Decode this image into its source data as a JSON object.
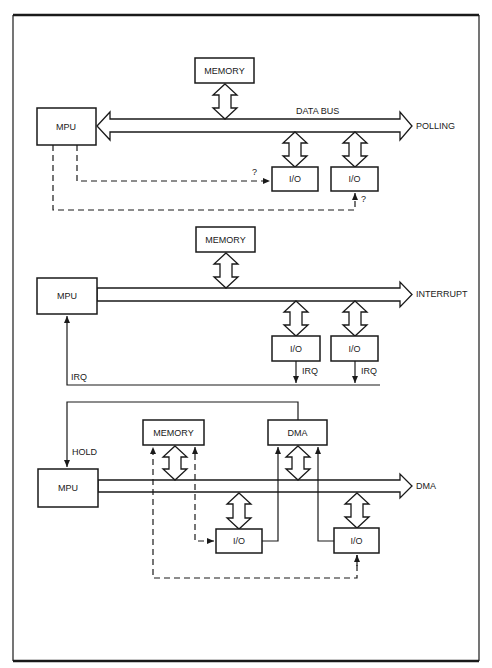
{
  "diagram": {
    "panels": [
      {
        "id": "polling",
        "mode_label": "POLLING",
        "bus_label": "DATA BUS",
        "mpu_label": "MPU",
        "memory_label": "MEMORY",
        "io_labels": [
          "I/O",
          "I/O"
        ],
        "query_labels": [
          "?",
          "?"
        ]
      },
      {
        "id": "interrupt",
        "mode_label": "INTERRUPT",
        "mpu_label": "MPU",
        "memory_label": "MEMORY",
        "io_labels": [
          "I/O",
          "I/O"
        ],
        "io_irq_labels": [
          "IRQ",
          "IRQ"
        ],
        "mpu_irq_label": "IRQ"
      },
      {
        "id": "dma",
        "mode_label": "DMA",
        "mpu_label": "MPU",
        "memory_label": "MEMORY",
        "dma_label": "DMA",
        "hold_label": "HOLD",
        "io_labels": [
          "I/O",
          "I/O"
        ]
      }
    ]
  },
  "colors": {
    "ink": "#1a1a1a",
    "paper": "#ffffff"
  }
}
